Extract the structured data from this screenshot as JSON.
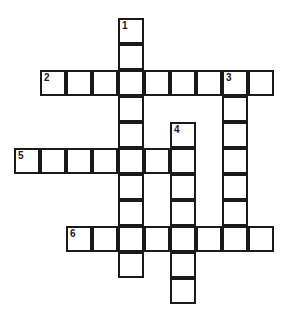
{
  "puzzle": {
    "kind": "crossword-grid",
    "cell_size": 26,
    "origin_x": 14,
    "origin_y": 18,
    "columns": 10,
    "rows": 12,
    "border_color": "#1a1a1a",
    "cell_fill": "#ffffff",
    "background": "#ffffff",
    "entries": [
      {
        "number": "1",
        "direction": "down",
        "col": 4,
        "row": 0,
        "length": 10
      },
      {
        "number": "2",
        "direction": "across",
        "col": 1,
        "row": 2,
        "length": 9
      },
      {
        "number": "3",
        "direction": "down",
        "col": 8,
        "row": 2,
        "length": 7
      },
      {
        "number": "4",
        "direction": "down",
        "col": 6,
        "row": 4,
        "length": 7
      },
      {
        "number": "5",
        "direction": "across",
        "col": 0,
        "row": 5,
        "length": 7
      },
      {
        "number": "6",
        "direction": "across",
        "col": 2,
        "row": 8,
        "length": 8
      }
    ],
    "cells": [
      {
        "col": 4,
        "row": 0,
        "number": "1",
        "letter": ""
      },
      {
        "col": 4,
        "row": 1,
        "number": "",
        "letter": ""
      },
      {
        "col": 1,
        "row": 2,
        "number": "2",
        "letter": ""
      },
      {
        "col": 2,
        "row": 2,
        "number": "",
        "letter": ""
      },
      {
        "col": 3,
        "row": 2,
        "number": "",
        "letter": ""
      },
      {
        "col": 4,
        "row": 2,
        "number": "",
        "letter": ""
      },
      {
        "col": 5,
        "row": 2,
        "number": "",
        "letter": ""
      },
      {
        "col": 6,
        "row": 2,
        "number": "",
        "letter": ""
      },
      {
        "col": 7,
        "row": 2,
        "number": "",
        "letter": ""
      },
      {
        "col": 8,
        "row": 2,
        "number": "3",
        "letter": ""
      },
      {
        "col": 9,
        "row": 2,
        "number": "",
        "letter": ""
      },
      {
        "col": 4,
        "row": 3,
        "number": "",
        "letter": ""
      },
      {
        "col": 8,
        "row": 3,
        "number": "",
        "letter": ""
      },
      {
        "col": 4,
        "row": 4,
        "number": "",
        "letter": ""
      },
      {
        "col": 6,
        "row": 4,
        "number": "4",
        "letter": ""
      },
      {
        "col": 8,
        "row": 4,
        "number": "",
        "letter": ""
      },
      {
        "col": 0,
        "row": 5,
        "number": "5",
        "letter": ""
      },
      {
        "col": 1,
        "row": 5,
        "number": "",
        "letter": ""
      },
      {
        "col": 2,
        "row": 5,
        "number": "",
        "letter": ""
      },
      {
        "col": 3,
        "row": 5,
        "number": "",
        "letter": ""
      },
      {
        "col": 4,
        "row": 5,
        "number": "",
        "letter": ""
      },
      {
        "col": 5,
        "row": 5,
        "number": "",
        "letter": ""
      },
      {
        "col": 6,
        "row": 5,
        "number": "",
        "letter": ""
      },
      {
        "col": 8,
        "row": 5,
        "number": "",
        "letter": ""
      },
      {
        "col": 4,
        "row": 6,
        "number": "",
        "letter": ""
      },
      {
        "col": 6,
        "row": 6,
        "number": "",
        "letter": ""
      },
      {
        "col": 8,
        "row": 6,
        "number": "",
        "letter": ""
      },
      {
        "col": 4,
        "row": 7,
        "number": "",
        "letter": ""
      },
      {
        "col": 6,
        "row": 7,
        "number": "",
        "letter": ""
      },
      {
        "col": 8,
        "row": 7,
        "number": "",
        "letter": ""
      },
      {
        "col": 2,
        "row": 8,
        "number": "6",
        "letter": ""
      },
      {
        "col": 3,
        "row": 8,
        "number": "",
        "letter": ""
      },
      {
        "col": 4,
        "row": 8,
        "number": "",
        "letter": ""
      },
      {
        "col": 5,
        "row": 8,
        "number": "",
        "letter": ""
      },
      {
        "col": 6,
        "row": 8,
        "number": "",
        "letter": ""
      },
      {
        "col": 7,
        "row": 8,
        "number": "",
        "letter": ""
      },
      {
        "col": 8,
        "row": 8,
        "number": "",
        "letter": ""
      },
      {
        "col": 9,
        "row": 8,
        "number": "",
        "letter": ""
      },
      {
        "col": 4,
        "row": 9,
        "number": "",
        "letter": ""
      },
      {
        "col": 6,
        "row": 9,
        "number": "",
        "letter": ""
      },
      {
        "col": 6,
        "row": 10,
        "number": "",
        "letter": ""
      }
    ]
  }
}
